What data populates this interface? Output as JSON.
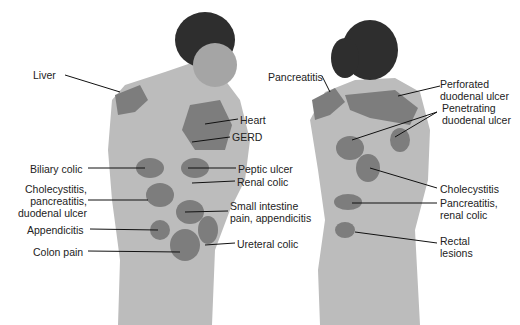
{
  "figure": {
    "front_labels": [
      {
        "text": "Liver",
        "x": 33,
        "y": 69
      },
      {
        "text": "Heart",
        "x": 240,
        "y": 114
      },
      {
        "text": "GERD",
        "x": 232,
        "y": 131
      },
      {
        "text": "Biliary colic",
        "x": 30,
        "y": 163
      },
      {
        "text": "Peptic ulcer",
        "x": 238,
        "y": 163
      },
      {
        "text": "Renal colic",
        "x": 237,
        "y": 176
      },
      {
        "text": "Cholecystitis,\npancreatitis,\nduodenal ulcer",
        "x": 20,
        "y": 183
      },
      {
        "text": "Small intestine\npain, appendicitis",
        "x": 230,
        "y": 200
      },
      {
        "text": "Appendicitis",
        "x": 27,
        "y": 224
      },
      {
        "text": "Ureteral colic",
        "x": 237,
        "y": 238
      },
      {
        "text": "Colon pain",
        "x": 33,
        "y": 246
      }
    ],
    "back_labels": [
      {
        "text": "Pancreatitis",
        "x": 268,
        "y": 71
      },
      {
        "text": "Perforated\nduodenal ulcer",
        "x": 440,
        "y": 78
      },
      {
        "text": "Penetrating\nduodenal ulcer",
        "x": 442,
        "y": 102
      },
      {
        "text": "Cholecystitis",
        "x": 440,
        "y": 183
      },
      {
        "text": "Pancreatitis,\nrenal colic",
        "x": 440,
        "y": 197
      },
      {
        "text": "Rectal\nlesions",
        "x": 440,
        "y": 235
      }
    ],
    "colors": {
      "skin": "#b9b9b9",
      "pain_zone": "#7d7d7d",
      "hair": "#2e2e2e",
      "leader": "#111111"
    }
  }
}
